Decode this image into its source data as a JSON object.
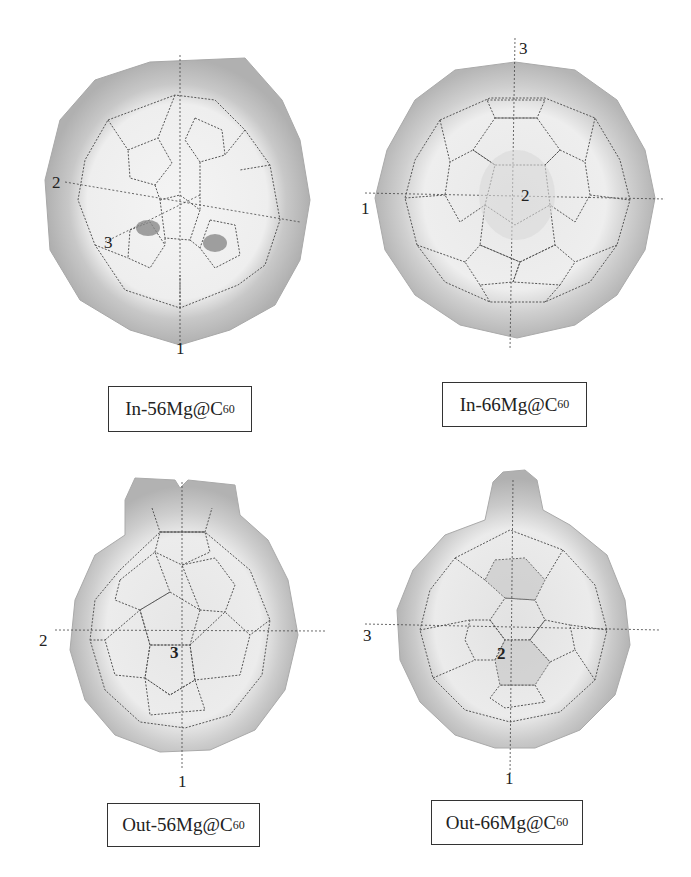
{
  "figure": {
    "panels": [
      {
        "id": "in-56",
        "label_prefix": "In-56Mg@C",
        "label_sub": "60",
        "axes": [
          {
            "name": "1",
            "position": "bottom"
          },
          {
            "name": "2",
            "position": "left"
          },
          {
            "name": "3",
            "position": "lower-left"
          }
        ]
      },
      {
        "id": "in-66",
        "label_prefix": "In-66Mg@C",
        "label_sub": "60",
        "axes": [
          {
            "name": "3",
            "position": "top"
          },
          {
            "name": "1",
            "position": "left"
          },
          {
            "name": "2",
            "position": "center"
          }
        ]
      },
      {
        "id": "out-56",
        "label_prefix": "Out-56Mg@C",
        "label_sub": "60",
        "axes": [
          {
            "name": "2",
            "position": "left"
          },
          {
            "name": "1",
            "position": "bottom"
          },
          {
            "name": "3",
            "position": "center"
          }
        ]
      },
      {
        "id": "out-66",
        "label_prefix": "Out-66Mg@C",
        "label_sub": "60",
        "axes": [
          {
            "name": "3",
            "position": "left"
          },
          {
            "name": "1",
            "position": "bottom"
          },
          {
            "name": "2",
            "position": "center"
          }
        ]
      }
    ],
    "colors": {
      "shell": "#bdbdbd",
      "shell_light": "#e6e6e6",
      "cage_line": "#555555",
      "axis_line": "#444444",
      "mg_spot": "#7a7a7a"
    }
  }
}
